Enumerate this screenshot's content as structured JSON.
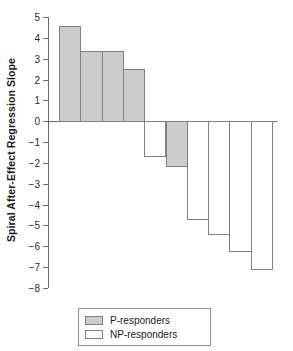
{
  "chart_data": {
    "type": "bar",
    "title": "",
    "xlabel": "",
    "ylabel": "Spiral After-Effect Regression Slope",
    "ylim": [
      -8,
      5
    ],
    "ytick_labels": [
      "5",
      "4",
      "3",
      "2",
      "1",
      "0",
      "−1",
      "−2",
      "−3",
      "−4",
      "−5",
      "−6",
      "−7",
      "−8"
    ],
    "ytick_values": [
      5,
      4,
      3,
      2,
      1,
      0,
      -1,
      -2,
      -3,
      -4,
      -5,
      -6,
      -7,
      -8
    ],
    "grid": false,
    "legend_position": "bottom-center",
    "categories": [
      "1",
      "2",
      "3",
      "4",
      "5",
      "6",
      "7",
      "8",
      "9",
      "10"
    ],
    "values": [
      4.55,
      3.35,
      3.35,
      2.5,
      -1.7,
      -2.2,
      -4.75,
      -5.45,
      -6.25,
      -7.15
    ],
    "groups": [
      "P-responders",
      "P-responders",
      "P-responders",
      "P-responders",
      "NP-responders",
      "P-responders",
      "NP-responders",
      "NP-responders",
      "NP-responders",
      "NP-responders"
    ],
    "series": [
      {
        "name": "P-responders",
        "fill": "#cccccc",
        "values": [
          4.55,
          3.35,
          3.35,
          2.5,
          null,
          -2.2,
          null,
          null,
          null,
          null
        ]
      },
      {
        "name": "NP-responders",
        "fill": "#ffffff",
        "values": [
          null,
          null,
          null,
          null,
          -1.7,
          null,
          -4.75,
          -5.45,
          -6.25,
          -7.15
        ]
      }
    ],
    "bars": [
      {
        "index": 1,
        "value": 4.55,
        "group": "P-responders",
        "fill": "#cccccc"
      },
      {
        "index": 2,
        "value": 3.35,
        "group": "P-responders",
        "fill": "#cccccc"
      },
      {
        "index": 3,
        "value": 3.35,
        "group": "P-responders",
        "fill": "#cccccc"
      },
      {
        "index": 4,
        "value": 2.5,
        "group": "P-responders",
        "fill": "#cccccc"
      },
      {
        "index": 5,
        "value": -1.7,
        "group": "NP-responders",
        "fill": "#ffffff"
      },
      {
        "index": 6,
        "value": -2.2,
        "group": "P-responders",
        "fill": "#cccccc"
      },
      {
        "index": 7,
        "value": -4.75,
        "group": "NP-responders",
        "fill": "#ffffff"
      },
      {
        "index": 8,
        "value": -5.45,
        "group": "NP-responders",
        "fill": "#ffffff"
      },
      {
        "index": 9,
        "value": -6.25,
        "group": "NP-responders",
        "fill": "#ffffff"
      },
      {
        "index": 10,
        "value": -7.15,
        "group": "NP-responders",
        "fill": "#ffffff"
      }
    ],
    "legend": [
      {
        "label": "P-responders",
        "fill": "#cccccc"
      },
      {
        "label": "NP-responders",
        "fill": "#ffffff"
      }
    ]
  },
  "colors": {
    "p_responder_fill": "#cccccc",
    "np_responder_fill": "#ffffff",
    "bar_edge": "#808080",
    "axis": "#6b6b6b",
    "text": "#1a1a1a",
    "background": "#ffffff"
  }
}
